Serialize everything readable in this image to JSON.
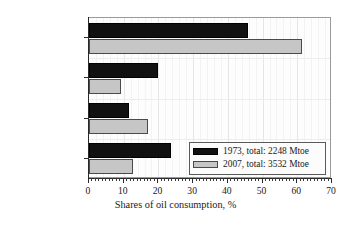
{
  "chart_data": {
    "type": "bar",
    "orientation": "horizontal",
    "title": "",
    "xlabel": "Shares of oil consumption, %",
    "ylabel": "",
    "xlim": [
      0,
      70
    ],
    "xticks": [
      0,
      10,
      20,
      30,
      40,
      50,
      60,
      70
    ],
    "xtick_labels": [
      "0",
      "10",
      "20",
      "30",
      "40",
      "50",
      "60",
      "70"
    ],
    "minor_tick_step": 1,
    "grid": true,
    "legend_position": "lower right",
    "categories": [
      "Transport",
      "Industry",
      "Nonenergy use",
      "Other sectors"
    ],
    "series": [
      {
        "name": "1973, total: 2248 Mtoe",
        "year": 1973,
        "total_mtoe": 2248,
        "color": "#111111",
        "values": [
          45.8,
          20.0,
          11.5,
          23.5
        ]
      },
      {
        "name": "2007, total: 3532 Mtoe",
        "year": 2007,
        "total_mtoe": 3532,
        "color": "#c6c6c6",
        "values": [
          61.3,
          9.2,
          17.0,
          12.7
        ]
      }
    ]
  },
  "axes": {
    "x_title": "Shares of oil consumption, %",
    "x_tick_labels": [
      "0",
      "10",
      "20",
      "30",
      "40",
      "50",
      "60",
      "70"
    ],
    "y_category_labels": [
      "Transport",
      "Industry",
      "Nonenergy use",
      "Other sectors"
    ]
  },
  "legend": {
    "entries": [
      {
        "label": "1973, total: 2248 Mtoe",
        "swatch": "black-filled-rect"
      },
      {
        "label": "2007, total: 3532 Mtoe",
        "swatch": "gray-filled-rect"
      }
    ]
  },
  "colors": {
    "series_1973": "#111111",
    "series_2007": "#c6c6c6",
    "frame": "#9a9a9a",
    "axis": "#2a2a2a",
    "plot_background": "#fdfdfd",
    "grid_major": "#e6e6e6",
    "grid_minor": "#f3f3f3"
  }
}
